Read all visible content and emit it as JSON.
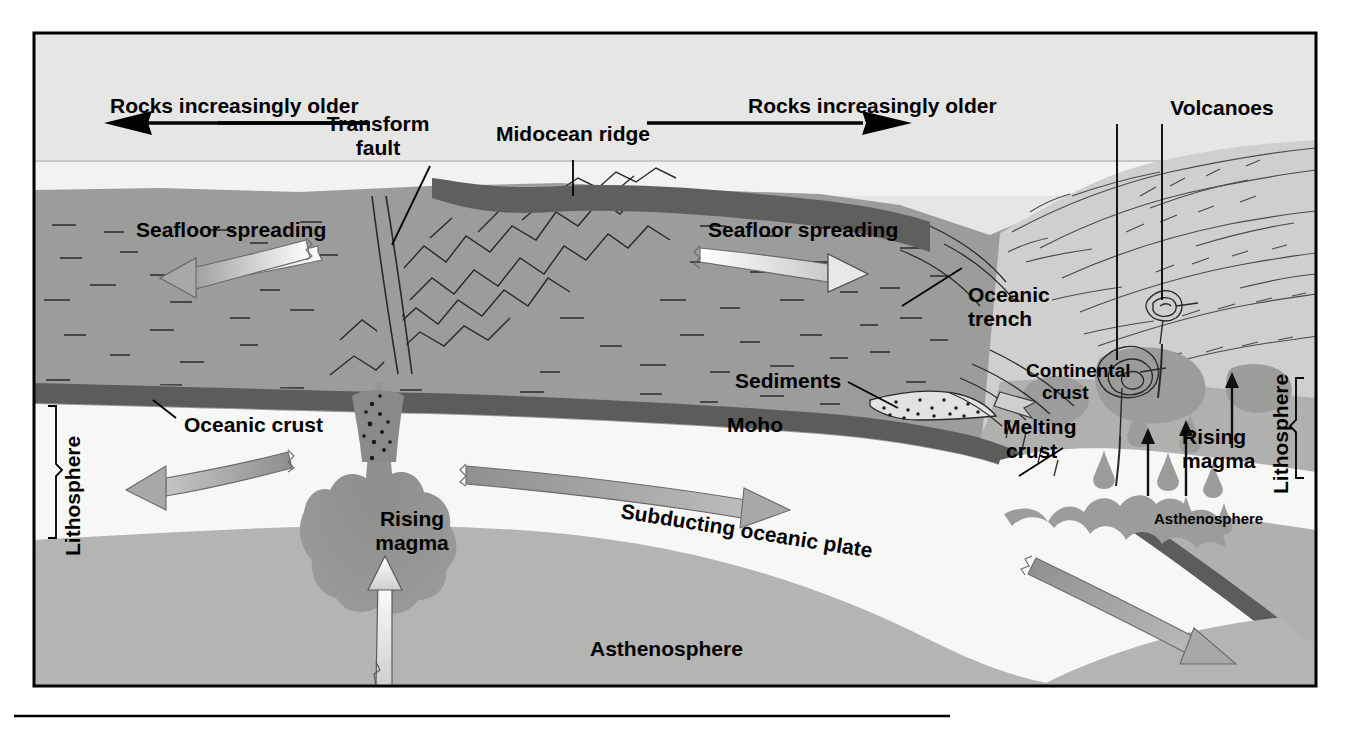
{
  "figure": {
    "type": "geology-cross-section",
    "frame": {
      "x": 33,
      "y": 32,
      "width": 1284,
      "height": 655
    },
    "caption_rule": {
      "x1": 14,
      "x2": 950,
      "y": 716
    }
  },
  "palette": {
    "sky": "#e6e6e4",
    "water": "#f2f2f0",
    "ocean_rock": "#9c9c9a",
    "ocean_rock_dark": "#6f6f6d",
    "crust_band": "#5c5c5a",
    "lithosphere": "#f7f7f5",
    "asthenosphere": "#b4b4b2",
    "magma": "#8a8a88",
    "continent_light": "#cfcfcd",
    "continent_mid": "#b0b0ae",
    "arrow_gray": "#a8a8a6",
    "arrow_white": "#fbfbf9",
    "ink": "#000000"
  },
  "labels": {
    "rocks_older_left": "Rocks increasingly older",
    "rocks_older_right": "Rocks increasingly older",
    "transform_fault_l1": "Transform",
    "transform_fault_l2": "fault",
    "midocean_ridge": "Midocean ridge",
    "volcanoes": "Volcanoes",
    "seafloor_spreading_left": "Seafloor spreading",
    "seafloor_spreading_right": "Seafloor spreading",
    "oceanic_trench_l1": "Oceanic",
    "oceanic_trench_l2": "trench",
    "sediments": "Sediments",
    "moho": "Moho",
    "oceanic_crust": "Oceanic crust",
    "continental_crust_l1": "Continental",
    "continental_crust_l2": "crust",
    "melting_crust_l1": "Melting",
    "melting_crust_l2": "crust",
    "rising_magma_right_l1": "Rising",
    "rising_magma_right_l2": "magma",
    "rising_magma_center_l1": "Rising",
    "rising_magma_center_l2": "magma",
    "subducting_plate": "Subducting oceanic plate",
    "asthenosphere_center": "Asthenosphere",
    "asthenosphere_right": "Asthenosphere",
    "lithosphere_left": "Lithosphere",
    "lithosphere_right": "Lithosphere"
  }
}
